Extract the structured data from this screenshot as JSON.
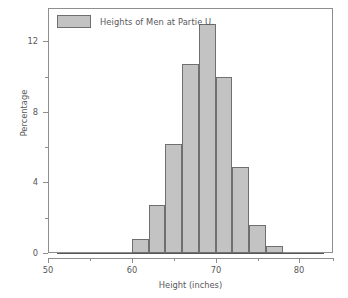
{
  "chart_data": {
    "type": "bar",
    "title": "",
    "subtitle": "",
    "xlabel": "Height (inches)",
    "ylabel": "Percentage",
    "legend": [
      {
        "label": "Heights of Men at Partie U.",
        "color": "#c3c3c3"
      }
    ],
    "legend_position": "top-left-inside",
    "grid": false,
    "bin_width": 2,
    "bin_edges": [
      60,
      62,
      64,
      66,
      68,
      70,
      72,
      74,
      76,
      78
    ],
    "categories": [
      "60-62",
      "62-64",
      "64-66",
      "66-68",
      "68-70",
      "70-72",
      "72-74",
      "74-76",
      "76-78"
    ],
    "values": [
      0.8,
      2.7,
      6.2,
      10.7,
      13.0,
      10.0,
      4.9,
      1.6,
      0.4
    ],
    "xlim": [
      50,
      84
    ],
    "ylim": [
      0,
      13.9
    ],
    "xticks": [
      50,
      60,
      70,
      80
    ],
    "xtick_labels": [
      "50",
      "60",
      "70",
      "80"
    ],
    "xticks_minor": [
      55,
      65,
      75
    ],
    "yticks": [
      0,
      4,
      8,
      12
    ],
    "ytick_labels": [
      "0",
      "4",
      "8",
      "12"
    ],
    "yticks_minor": [
      2,
      6,
      10
    ],
    "bar_fill": "#c3c3c3",
    "bar_edge": "#6f6f71",
    "axis_color": "#8e8e90",
    "text_color": "#58585a",
    "background": "#ffffff"
  }
}
